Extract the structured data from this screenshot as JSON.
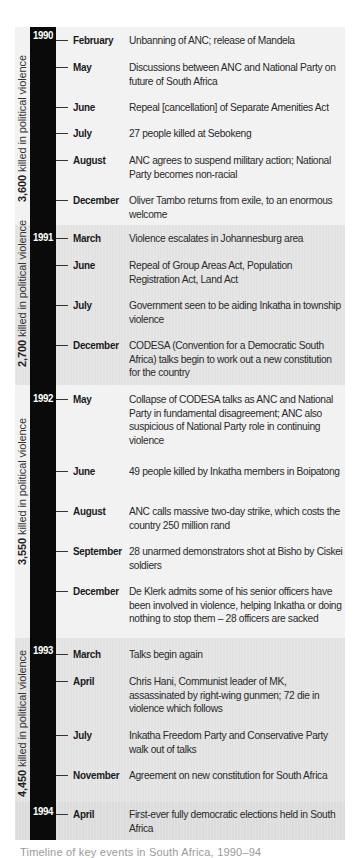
{
  "timeline": {
    "periods": [
      {
        "year": "1990",
        "deaths_number": "3,600",
        "deaths_text": " killed in political violence",
        "events": [
          {
            "month": "February",
            "text": "Unbanning of ANC; release of Mandela"
          },
          {
            "month": "May",
            "text": "Discussions between ANC and National Party on future of South Africa"
          },
          {
            "month": "June",
            "text": "Repeal [cancellation] of Separate Amenities Act"
          },
          {
            "month": "July",
            "text": "27 people killed at Sebokeng"
          },
          {
            "month": "August",
            "text": "ANC agrees to suspend military action; National Party becomes non-racial"
          },
          {
            "month": "December",
            "text": "Oliver Tambo returns from exile, to an enormous welcome"
          }
        ]
      },
      {
        "year": "1991",
        "deaths_number": "2,700",
        "deaths_text": " killed in political violence",
        "events": [
          {
            "month": "March",
            "text": "Violence escalates in Johannesburg area"
          },
          {
            "month": "June",
            "text": "Repeal of Group Areas Act, Population Registration Act, Land Act"
          },
          {
            "month": "July",
            "text": "Government seen to be aiding Inkatha in township violence"
          },
          {
            "month": "December",
            "text": "CODESA (Convention for a Democratic South Africa) talks begin to work out a new constitution for the country"
          }
        ]
      },
      {
        "year": "1992",
        "deaths_number": "3,550",
        "deaths_text": " killed in political violence",
        "events": [
          {
            "month": "May",
            "text": "Collapse of CODESA talks as ANC and National Party in fundamental disagreement; ANC also suspicious of National Party role in continuing violence"
          },
          {
            "month": "June",
            "text": "49 people killed by Inkatha members in Boipatong"
          },
          {
            "month": "August",
            "text": "ANC calls massive two-day strike, which costs the country 250 million rand"
          },
          {
            "month": "September",
            "text": "28 unarmed demonstrators shot at Bisho by Ciskei soldiers"
          },
          {
            "month": "December",
            "text": "De Klerk admits some of his senior officers have been involved in violence, helping Inkatha or doing nothing to stop them – 28 officers are sacked"
          }
        ]
      },
      {
        "year": "1993",
        "deaths_number": "4,450",
        "deaths_text": " killed in political violence",
        "events": [
          {
            "month": "March",
            "text": "Talks begin again"
          },
          {
            "month": "April",
            "text": "Chris Hani, Communist leader of MK, assassinated by right-wing gunmen; 72 die in violence which follows"
          },
          {
            "month": "July",
            "text": "Inkatha Freedom Party and Conservative Party walk out of talks"
          },
          {
            "month": "November",
            "text": "Agreement on new constitution for South Africa"
          }
        ]
      },
      {
        "year": "1994",
        "events": [
          {
            "month": "April",
            "text": "First-ever fully democratic elections held in South Africa"
          }
        ]
      }
    ]
  },
  "caption": "Timeline of key events in South Africa, 1990–94"
}
